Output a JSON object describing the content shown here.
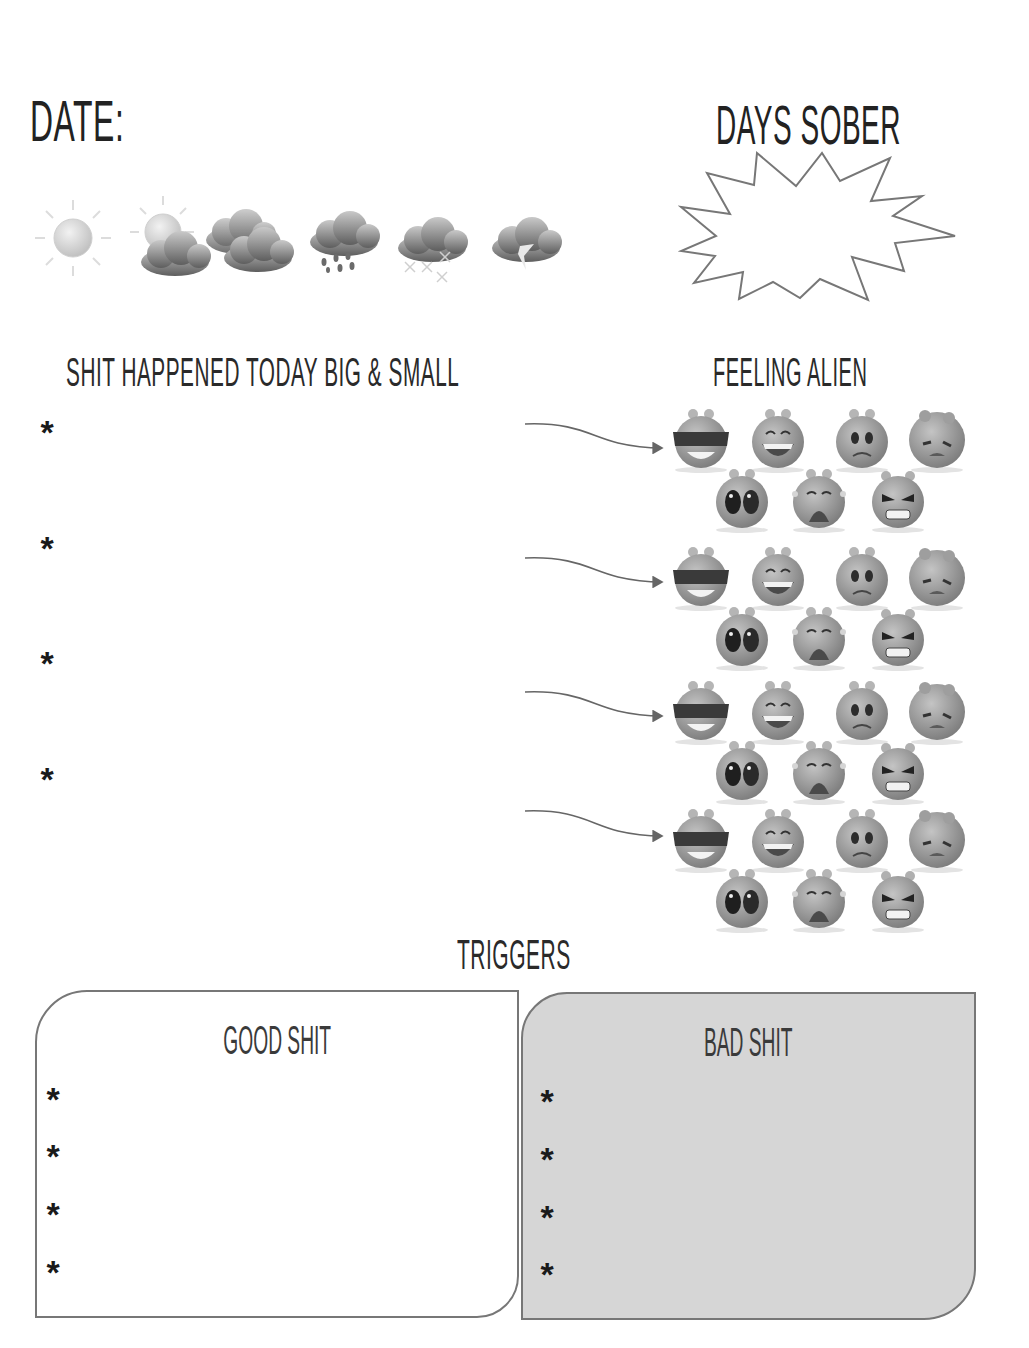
{
  "header": {
    "date_label": "Date:",
    "days_sober_label": "Days Sober",
    "days_sober_value": ""
  },
  "weather": {
    "options": [
      {
        "name": "sunny",
        "icon": "sun-icon"
      },
      {
        "name": "partly-cloudy",
        "icon": "sun-behind-cloud-icon"
      },
      {
        "name": "cloudy",
        "icon": "clouds-icon"
      },
      {
        "name": "rainy",
        "icon": "rain-cloud-icon"
      },
      {
        "name": "snowy",
        "icon": "snow-cloud-icon"
      },
      {
        "name": "stormy",
        "icon": "lightning-cloud-icon"
      }
    ]
  },
  "events": {
    "heading": "Shit Happened Today Big & Small",
    "bullet": "*",
    "items": [
      "",
      "",
      "",
      ""
    ]
  },
  "feelings": {
    "heading": "Feeling alien",
    "faces": [
      "cool",
      "laughing",
      "worried",
      "sad",
      "scared",
      "crying",
      "angry"
    ]
  },
  "triggers": {
    "heading": "Triggers",
    "good": {
      "title": "Good Shit",
      "bullet": "*",
      "items": [
        "",
        "",
        "",
        ""
      ]
    },
    "bad": {
      "title": "Bad Shit",
      "bullet": "*",
      "items": [
        "",
        "",
        "",
        ""
      ]
    }
  },
  "colors": {
    "ink": "#1e1e1e",
    "outline": "#777777",
    "bad_box_fill": "#d6d6d6",
    "alien_gray": "#8c8c8c"
  }
}
